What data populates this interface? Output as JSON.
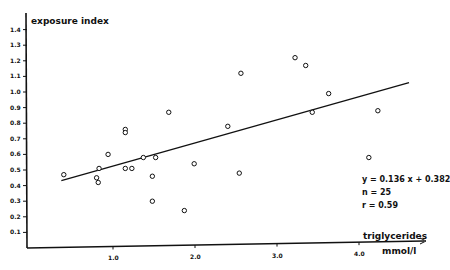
{
  "chart_data": {
    "type": "scatter",
    "title": "",
    "xlabel": "triglycerides",
    "xunit": "mmol/l",
    "ylabel": "exposure index",
    "xlim": [
      0,
      4.7
    ],
    "ylim": [
      0,
      1.5
    ],
    "x_ticks": [
      {
        "value": 1.0,
        "label": "1.0"
      },
      {
        "value": 2.0,
        "label": "2.0"
      },
      {
        "value": 3.0,
        "label": "3.0"
      },
      {
        "value": 4.0,
        "label": "4.0"
      }
    ],
    "y_ticks": [
      {
        "value": 0.1,
        "label": "0.1"
      },
      {
        "value": 0.2,
        "label": "0.2"
      },
      {
        "value": 0.3,
        "label": "0.3"
      },
      {
        "value": 0.4,
        "label": "0.4"
      },
      {
        "value": 0.5,
        "label": "0.5"
      },
      {
        "value": 0.6,
        "label": "0.6"
      },
      {
        "value": 0.7,
        "label": "0.7"
      },
      {
        "value": 0.8,
        "label": "0.8"
      },
      {
        "value": 0.9,
        "label": "0.9"
      },
      {
        "value": 1.0,
        "label": "1.0"
      },
      {
        "value": 1.1,
        "label": "1.1"
      },
      {
        "value": 1.2,
        "label": "1.2"
      },
      {
        "value": 1.3,
        "label": "1.3"
      },
      {
        "value": 1.4,
        "label": "1.4"
      }
    ],
    "grid": false,
    "series": [
      {
        "name": "observations",
        "marker": "open-circle",
        "points": [
          [
            0.4,
            0.47
          ],
          [
            0.83,
            0.51
          ],
          [
            0.8,
            0.45
          ],
          [
            0.82,
            0.42
          ],
          [
            0.94,
            0.6
          ],
          [
            1.15,
            0.76
          ],
          [
            1.15,
            0.74
          ],
          [
            1.15,
            0.51
          ],
          [
            1.23,
            0.51
          ],
          [
            1.37,
            0.58
          ],
          [
            1.52,
            0.58
          ],
          [
            1.48,
            0.46
          ],
          [
            1.48,
            0.3
          ],
          [
            1.68,
            0.87
          ],
          [
            1.99,
            0.54
          ],
          [
            1.87,
            0.24
          ],
          [
            2.4,
            0.78
          ],
          [
            2.54,
            0.48
          ],
          [
            2.56,
            1.12
          ],
          [
            3.22,
            1.22
          ],
          [
            3.35,
            1.17
          ],
          [
            3.43,
            0.87
          ],
          [
            3.63,
            0.99
          ],
          [
            4.23,
            0.88
          ],
          [
            4.12,
            0.58
          ]
        ]
      }
    ],
    "regression": {
      "slope": 0.136,
      "intercept": 0.382,
      "x_start": 0.37,
      "x_end": 4.61
    },
    "annotations": [
      "y = 0.136 x + 0.382",
      "n = 25",
      "r = 0.59"
    ]
  }
}
